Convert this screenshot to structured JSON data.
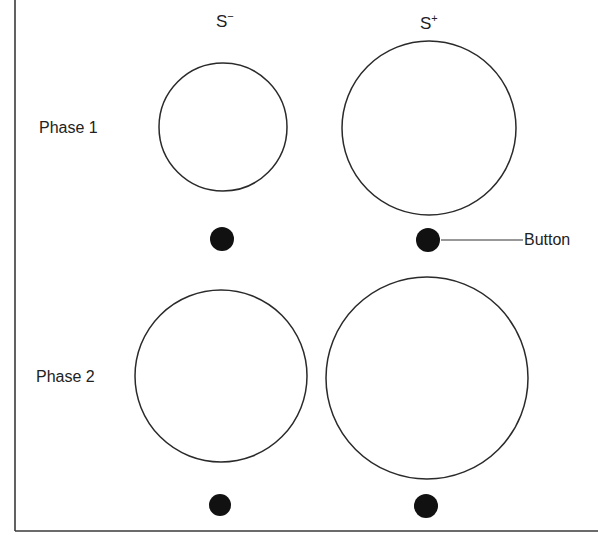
{
  "figure": {
    "columns": [
      {
        "id": "s-minus",
        "label": "S",
        "superscript": "−",
        "x": 223
      },
      {
        "id": "s-plus",
        "label": "S",
        "superscript": "+",
        "x": 428
      }
    ],
    "rows": [
      {
        "id": "phase-1",
        "label": "Phase 1",
        "stimuli": [
          {
            "column": "s-minus",
            "cx": 223,
            "cy": 127,
            "r": 64
          },
          {
            "column": "s-plus",
            "cx": 429,
            "cy": 128,
            "r": 87
          }
        ],
        "buttons": [
          {
            "column": "s-minus",
            "cx": 222,
            "cy": 239,
            "r": 12
          },
          {
            "column": "s-plus",
            "cx": 428,
            "cy": 240,
            "r": 12
          }
        ]
      },
      {
        "id": "phase-2",
        "label": "Phase 2",
        "stimuli": [
          {
            "column": "s-minus",
            "cx": 221,
            "cy": 376,
            "r": 86
          },
          {
            "column": "s-plus",
            "cx": 427,
            "cy": 378,
            "r": 101
          }
        ],
        "buttons": [
          {
            "column": "s-minus",
            "cx": 220,
            "cy": 505,
            "r": 11
          },
          {
            "column": "s-plus",
            "cx": 426,
            "cy": 506,
            "r": 12
          }
        ]
      }
    ],
    "annotation": {
      "label": "Button",
      "line_from": [
        441,
        240
      ],
      "line_to": [
        523,
        240
      ]
    },
    "frame": {
      "left_x": 15,
      "bottom_y": 531
    },
    "colors": {
      "stroke": "#2a2a2a",
      "fill_button": "#111111",
      "background": "#ffffff"
    }
  }
}
